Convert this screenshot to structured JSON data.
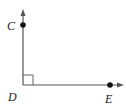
{
  "diagram": {
    "type": "right-angle",
    "vertex": {
      "label": "D",
      "x": 23,
      "y": 85
    },
    "points": [
      {
        "label": "C",
        "x": 23,
        "y": 25,
        "label_x": 8,
        "label_y": 30
      },
      {
        "label": "E",
        "x": 110,
        "y": 85,
        "label_x": 105,
        "label_y": 102
      }
    ],
    "rays": [
      {
        "name": "DC",
        "direction": "up"
      },
      {
        "name": "DE",
        "direction": "right"
      }
    ],
    "right_angle_marker": true,
    "colors": {
      "line": "#555555",
      "point": "#111111",
      "text": "#222222"
    }
  }
}
